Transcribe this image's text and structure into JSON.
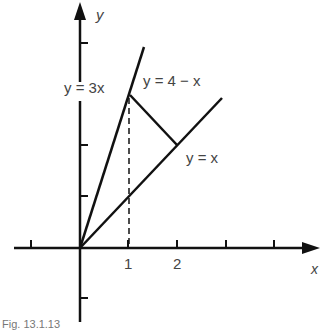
{
  "figure": {
    "caption": "Fig. 13.1.13",
    "axes": {
      "x_label": "x",
      "y_label": "y",
      "x_tick_labels": [
        "1",
        "2"
      ]
    },
    "lines": [
      {
        "name": "y = 3x",
        "label": "y = 3x"
      },
      {
        "name": "y = 4 − x",
        "label": "y = 4 − x"
      },
      {
        "name": "y = x",
        "label": "y = x"
      }
    ],
    "dashed_guide": "x = 1",
    "colors": {
      "ink": "#111111",
      "label": "#444444"
    }
  }
}
